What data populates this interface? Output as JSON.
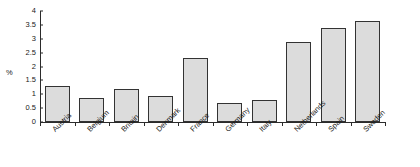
{
  "chart_data": {
    "type": "bar",
    "title": "",
    "subtitle": "",
    "xlabel": "",
    "ylabel": "%",
    "ylim": [
      0,
      4
    ],
    "ytick_values": [
      0,
      0.5,
      1,
      1.5,
      2,
      2.5,
      3,
      3.5,
      4
    ],
    "ytick_labels": [
      "0",
      "0.5",
      "1",
      "1.5",
      "2",
      "2.5",
      "3",
      "3.5",
      "4"
    ],
    "grid": false,
    "legend": null,
    "categories": [
      "Austria",
      "Belgium",
      "Britain",
      "Denmark",
      "France",
      "Germany",
      "Italy",
      "Netherlands",
      "Spain",
      "Sweden"
    ],
    "values": [
      1.3,
      0.85,
      1.2,
      0.95,
      2.3,
      0.7,
      0.8,
      2.9,
      3.4,
      3.65
    ],
    "bar_color": "#dcdcdc",
    "bar_edge_color": "#333333",
    "axis_color": "#2b2b2b",
    "background_color": "#ffffff"
  }
}
